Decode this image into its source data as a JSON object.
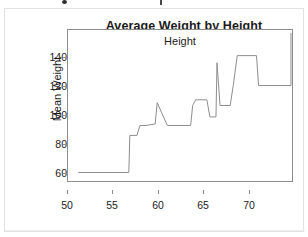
{
  "top_cut_row": {
    "text": "",
    "bullet_icon": "bullet-dot-icon",
    "tick_icon": "caret-mark-icon"
  },
  "chart_data": {
    "type": "line",
    "subtype": "step",
    "title": "Average Weight by Height",
    "xlabel": "Height",
    "ylabel": "Mean Weight",
    "xlim": [
      50.3,
      72.4
    ],
    "ylim": [
      45.0,
      151.0
    ],
    "xticks": [
      50,
      55,
      60,
      65,
      70
    ],
    "yticks": [
      60,
      80,
      100,
      120,
      140
    ],
    "xtick_labels": [
      "50",
      "55",
      "60",
      "65",
      "70"
    ],
    "ytick_labels": [
      "60",
      "80",
      "100",
      "120",
      "140"
    ],
    "grid": false,
    "legend": null,
    "line_color": "#8d8d8d",
    "frame_color": "#8d8d8d",
    "background": "#ffffff",
    "x": [
      51.3,
      56.3,
      56.4,
      57.1,
      57.4,
      58.0,
      58.9,
      59.1,
      60.1,
      62.4,
      62.6,
      62.9,
      64.0,
      64.3,
      64.9,
      65.0,
      65.3,
      66.3,
      66.6,
      67.0,
      68.9,
      69.1,
      72.3,
      72.3
    ],
    "y": [
      51,
      51,
      77,
      77,
      84,
      84,
      85,
      100,
      84,
      84,
      98,
      102,
      102,
      90,
      90,
      128,
      98,
      98,
      112,
      133,
      133,
      112,
      112,
      149
    ],
    "steps": [
      {
        "x_start": 51.3,
        "x_end": 56.3,
        "value": 51
      },
      {
        "x_start": 56.3,
        "x_end": 57.2,
        "value": 77
      },
      {
        "x_start": 57.2,
        "x_end": 58.9,
        "value": 84
      },
      {
        "x_start": 58.9,
        "x_end": 59.1,
        "value": 85
      },
      {
        "x_start": 59.1,
        "x_end": 60.1,
        "value": 100
      },
      {
        "x_start": 60.1,
        "x_end": 62.5,
        "value": 84
      },
      {
        "x_start": 62.5,
        "x_end": 62.9,
        "value": 98
      },
      {
        "x_start": 62.9,
        "x_end": 64.2,
        "value": 102
      },
      {
        "x_start": 64.2,
        "x_end": 64.9,
        "value": 90
      },
      {
        "x_start": 64.9,
        "x_end": 65.2,
        "value": 128
      },
      {
        "x_start": 65.2,
        "x_end": 66.5,
        "value": 98
      },
      {
        "x_start": 66.5,
        "x_end": 67.0,
        "value": 112
      },
      {
        "x_start": 67.0,
        "x_end": 69.0,
        "value": 133
      },
      {
        "x_start": 69.0,
        "x_end": 72.3,
        "value": 112
      },
      {
        "x_start": 72.3,
        "x_end": 72.3,
        "value": 149
      }
    ]
  }
}
